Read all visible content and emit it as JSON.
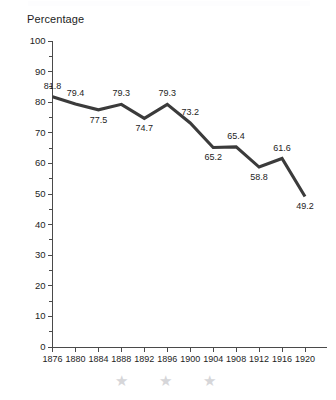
{
  "figure": {
    "axis_title": "Percentage",
    "line_color": "#3b3b3b",
    "axis_color": "#4a4a4a",
    "text_color": "#1d1d1d",
    "star_color": "#d6d6d9",
    "background": "#ffffff"
  },
  "decorations": {
    "stars": [
      {
        "glyph": "★",
        "name": "star-decoration-1"
      },
      {
        "glyph": "★",
        "name": "star-decoration-2"
      },
      {
        "glyph": "★",
        "name": "star-decoration-3"
      }
    ]
  },
  "chart_data": {
    "type": "line",
    "title": "",
    "subtitle": "",
    "xlabel": "",
    "ylabel": "Percentage",
    "ylim": [
      0,
      100
    ],
    "xlim": [
      1876,
      1920
    ],
    "grid": false,
    "legend": null,
    "y_major_step": 10,
    "y_minor_step": 5,
    "x_step": 4,
    "categories": [
      "1876",
      "1880",
      "1884",
      "1888",
      "1892",
      "1896",
      "1900",
      "1904",
      "1908",
      "1912",
      "1916",
      "1920"
    ],
    "x": [
      1876,
      1880,
      1884,
      1888,
      1892,
      1896,
      1900,
      1904,
      1908,
      1912,
      1916,
      1920
    ],
    "values": [
      81.8,
      79.4,
      77.5,
      79.3,
      74.7,
      79.3,
      73.2,
      65.2,
      65.4,
      58.8,
      61.6,
      49.2
    ],
    "data_labels": [
      "81.8",
      "79.4",
      "77.5",
      "79.3",
      "74.7",
      "79.3",
      "73.2",
      "65.2",
      "65.4",
      "58.8",
      "61.6",
      "49.2"
    ],
    "data_label_positions": [
      "above",
      "above",
      "below",
      "above",
      "below",
      "above",
      "above",
      "below",
      "above",
      "below",
      "above",
      "below"
    ],
    "ytick_labels": [
      "100",
      "90",
      "80",
      "70",
      "60",
      "50",
      "40",
      "30",
      "20",
      "10",
      "0"
    ],
    "ytick_values": [
      100,
      90,
      80,
      70,
      60,
      50,
      40,
      30,
      20,
      10,
      0
    ],
    "yminor_values": [
      95,
      85,
      75,
      65,
      55,
      45,
      35,
      25,
      15,
      5
    ]
  }
}
